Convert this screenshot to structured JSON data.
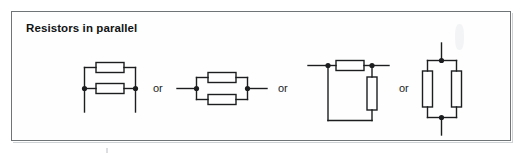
{
  "figure": {
    "title": "Resistors in parallel",
    "background_color": "#ffffff",
    "frame_color": "#6f7477",
    "ink_color": "#1b1d1f",
    "connectors": {
      "or_1": "or",
      "or_2": "or",
      "or_3": "or"
    },
    "circuits": [
      {
        "name": "ladder-parallel-vertical-leads",
        "orientation": "horizontal-resistors",
        "resistor_count": 2,
        "resistor_orientation": "horizontal",
        "node_dots": 2,
        "lead_direction": "down"
      },
      {
        "name": "inline-parallel-horizontal-leads",
        "orientation": "horizontal-resistors",
        "resistor_count": 2,
        "resistor_orientation": "horizontal",
        "node_dots": 2,
        "lead_direction": "left-right"
      },
      {
        "name": "loop-parallel-mixed",
        "orientation": "mixed",
        "resistor_count": 2,
        "resistor_orientation": "one-horizontal-one-vertical",
        "node_dots": 2,
        "lead_direction": "left-right"
      },
      {
        "name": "vertical-parallel-vertical-leads",
        "orientation": "vertical-resistors",
        "resistor_count": 2,
        "resistor_orientation": "vertical",
        "node_dots": 2,
        "lead_direction": "up-down"
      }
    ]
  }
}
